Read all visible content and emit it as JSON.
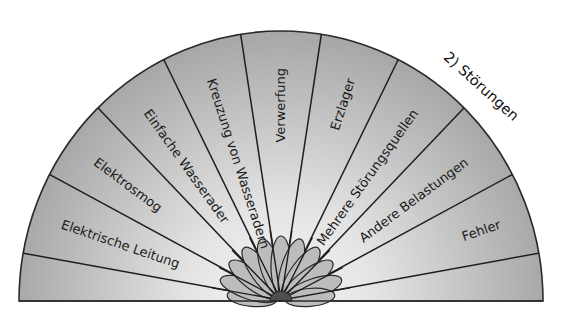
{
  "diagram": {
    "title": "2) Störungen",
    "sectors": [
      {
        "label": ""
      },
      {
        "label": "Elektrische Leitung"
      },
      {
        "label": "Elektrosmog"
      },
      {
        "label": "Einfache Wasserader"
      },
      {
        "label": "Kreuzung von Wasseradern"
      },
      {
        "label": "Verwerfung"
      },
      {
        "label": "Erzlager"
      },
      {
        "label": "Mehrere Störungsquellen"
      },
      {
        "label": "Andere Belastungen"
      },
      {
        "label": "Fehler"
      },
      {
        "label": ""
      }
    ],
    "colors": {
      "fill_center": "#f4f4f4",
      "fill_edge": "#a9a9a9",
      "stroke": "#1e1e1e",
      "petal": "#bdbdbd",
      "hub": "#505050"
    }
  }
}
